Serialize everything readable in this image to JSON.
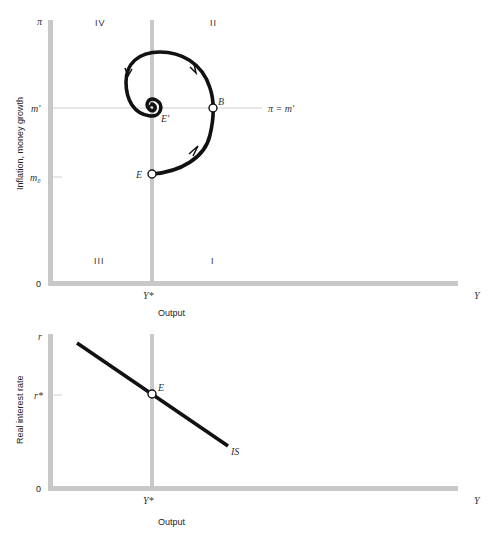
{
  "top_diagram": {
    "y_axis_label": "Inflation, money growth",
    "x_axis_label": "Output",
    "y_ticks": {
      "top": "π",
      "m_prime": "m′",
      "m0": "m₀",
      "origin": "0"
    },
    "x_ticks": {
      "y_star": "Y*",
      "end": "Y"
    },
    "quadrants": {
      "q1": "I",
      "q2": "II",
      "q3": "III",
      "q4": "IV"
    },
    "points": {
      "E": "E",
      "B": "B",
      "E_prime": "E′"
    },
    "line_label": "π = m′"
  },
  "bottom_diagram": {
    "y_axis_label": "Real interest rate",
    "x_axis_label": "Output",
    "y_ticks": {
      "top": "r",
      "r_star": "r*",
      "origin": "0"
    },
    "x_ticks": {
      "y_star": "Y*",
      "end": "Y"
    },
    "points": {
      "E": "E"
    },
    "curve_label": "IS"
  },
  "colors": {
    "axis": "#c8c8c8",
    "curve": "#111111",
    "guide": "#d0d0d0"
  }
}
